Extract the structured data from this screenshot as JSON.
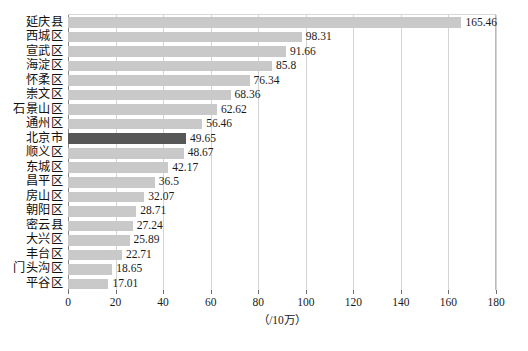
{
  "chart_data": {
    "type": "bar",
    "orientation": "horizontal",
    "title": "",
    "xlabel": "（/10万）",
    "ylabel": "",
    "xlim": [
      0,
      180
    ],
    "xticks": [
      0,
      20,
      40,
      60,
      80,
      100,
      120,
      140,
      160,
      180
    ],
    "grid": "vertical",
    "legend": "none",
    "categories": [
      "延庆县",
      "西城区",
      "宣武区",
      "海淀区",
      "怀柔区",
      "崇文区",
      "石景山区",
      "通州区",
      "北京市",
      "顺义区",
      "东城区",
      "昌平区",
      "房山区",
      "朝阳区",
      "密云县",
      "大兴区",
      "丰台区",
      "门头沟区",
      "平谷区"
    ],
    "values": [
      165.46,
      98.31,
      91.66,
      85.8,
      76.34,
      68.36,
      62.62,
      56.46,
      49.65,
      48.67,
      42.17,
      36.5,
      32.07,
      28.71,
      27.24,
      25.89,
      22.71,
      18.65,
      17.01
    ],
    "value_labels": [
      "165.46",
      "98.31",
      "91.66",
      "85.8",
      "76.34",
      "68.36",
      "62.62",
      "56.46",
      "49.65",
      "48.67",
      "42.17",
      "36.5",
      "32.07",
      "28.71",
      "27.24",
      "25.89",
      "22.71",
      "18.65",
      "17.01"
    ],
    "highlighted_index": 8,
    "colors": {
      "bar": "#c9c9c9",
      "bar_highlight": "#575757",
      "gridline": "#d3d3d3",
      "axis": "#8a8a8a",
      "background": "#ffffff",
      "text": "#1a1a1a"
    }
  },
  "caption": ""
}
